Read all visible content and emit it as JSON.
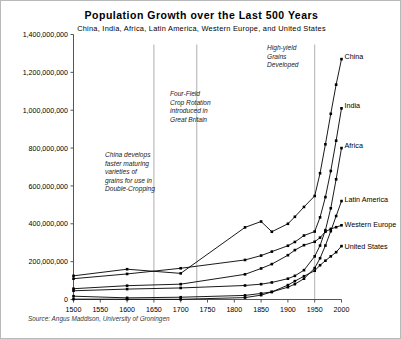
{
  "chart_data": {
    "type": "line",
    "title": "Population Growth over the Last 500 Years",
    "subtitle": "China, India, Africa, Latin America, Western Europe, and United States",
    "xlabel": "",
    "ylabel": "",
    "xlim": [
      1500,
      2000
    ],
    "ylim": [
      0,
      1400000000
    ],
    "xticks": [
      1500,
      1550,
      1600,
      1650,
      1700,
      1750,
      1800,
      1850,
      1900,
      1950,
      2000
    ],
    "xticklabels": [
      "1500",
      "1550",
      "1600",
      "1650",
      "1700",
      "1750",
      "1800",
      "1850",
      "1900",
      "1950",
      "2000"
    ],
    "yticks": [
      0,
      200000000,
      400000000,
      600000000,
      800000000,
      1000000000,
      1200000000,
      1400000000
    ],
    "yticklabels": [
      "0",
      "200,000,000",
      "400,000,000",
      "600,000,000",
      "800,000,000",
      "1,000,000,000",
      "1,200,000,000",
      "1,400,000,000"
    ],
    "grid": false,
    "legend_position": "right-inline-labels",
    "marker": "square",
    "line_color": "#000000",
    "source": "Source: Angus Maddison, University of Groningen",
    "series": [
      {
        "name": "China",
        "label": "China",
        "x": [
          1500,
          1600,
          1700,
          1820,
          1850,
          1870,
          1900,
          1913,
          1930,
          1950,
          1960,
          1970,
          1980,
          1990,
          2000
        ],
        "values": [
          125000000,
          160000000,
          138000000,
          381000000,
          412000000,
          358000000,
          400000000,
          437000000,
          489000000,
          547000000,
          667000000,
          820000000,
          981000000,
          1135000000,
          1270000000
        ]
      },
      {
        "name": "India",
        "label": "India",
        "x": [
          1500,
          1600,
          1700,
          1820,
          1850,
          1870,
          1900,
          1913,
          1930,
          1950,
          1960,
          1970,
          1980,
          1990,
          2000
        ],
        "values": [
          110000000,
          135000000,
          165000000,
          209000000,
          232000000,
          253000000,
          284000000,
          304000000,
          338000000,
          359000000,
          434000000,
          541000000,
          679000000,
          839000000,
          1010000000
        ]
      },
      {
        "name": "Africa",
        "label": "Africa",
        "x": [
          1500,
          1600,
          1700,
          1820,
          1850,
          1870,
          1900,
          1913,
          1930,
          1950,
          1960,
          1970,
          1980,
          1990,
          2000
        ],
        "values": [
          46000000,
          55000000,
          61000000,
          74000000,
          81000000,
          90000000,
          110000000,
          125000000,
          155000000,
          228000000,
          285000000,
          366000000,
          482000000,
          635000000,
          800000000
        ]
      },
      {
        "name": "Latin America",
        "label": "Latin America",
        "x": [
          1500,
          1600,
          1700,
          1820,
          1850,
          1870,
          1900,
          1913,
          1930,
          1950,
          1960,
          1970,
          1980,
          1990,
          2000
        ],
        "values": [
          17500000,
          8600000,
          12000000,
          21600000,
          32000000,
          40000000,
          65000000,
          81000000,
          110000000,
          166000000,
          218000000,
          285000000,
          361000000,
          441000000,
          520000000
        ]
      },
      {
        "name": "Western Europe",
        "label": "Western Europe",
        "x": [
          1500,
          1600,
          1700,
          1820,
          1850,
          1870,
          1900,
          1913,
          1930,
          1950,
          1960,
          1970,
          1980,
          1990,
          2000
        ],
        "values": [
          57000000,
          73000000,
          81000000,
          133000000,
          164000000,
          187000000,
          234000000,
          261000000,
          287000000,
          305000000,
          327000000,
          358000000,
          373000000,
          382000000,
          392000000
        ]
      },
      {
        "name": "United States",
        "label": "United States",
        "x": [
          1500,
          1600,
          1700,
          1820,
          1850,
          1870,
          1900,
          1913,
          1930,
          1950,
          1960,
          1970,
          1980,
          1990,
          2000
        ],
        "values": [
          2000000,
          1500000,
          1000000,
          10000000,
          23000000,
          40000000,
          76000000,
          97000000,
          123000000,
          152000000,
          181000000,
          205000000,
          228000000,
          250000000,
          282000000
        ]
      }
    ],
    "annotations": [
      {
        "id": "double-cropping",
        "text": "China develops\nfaster maturing\nvarieties of\ngrains for use in\nDouble-Cropping",
        "x": 1650
      },
      {
        "id": "four-field-crop-rotation",
        "text": "Four-Field\nCrop Rotation\nintroduced in\nGreat Britain",
        "x": 1730
      },
      {
        "id": "high-yield-grains",
        "text": "High-yield\nGrains\nDeveloped",
        "x": 1950
      }
    ]
  }
}
